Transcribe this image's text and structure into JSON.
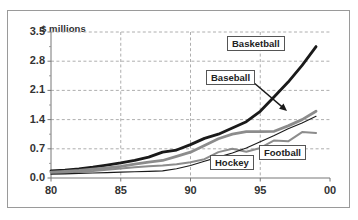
{
  "figure": {
    "width": 358,
    "height": 220,
    "background": "#ffffff",
    "frame_color": "#9a9a9a"
  },
  "chart_data": {
    "type": "line",
    "title": "",
    "subtitle": "",
    "xlabel": "",
    "ylabel": "$ millions",
    "ylabel_position": "top-left",
    "grid": true,
    "grid_style": "dashed",
    "grid_color": "#999999",
    "legend_position": "inline-labels",
    "xlim": [
      80,
      100
    ],
    "ylim": [
      0.0,
      3.5
    ],
    "x_ticks": [
      "80",
      "85",
      "90",
      "95",
      "00"
    ],
    "x_tick_values": [
      80,
      85,
      90,
      95,
      100
    ],
    "y_ticks": [
      "0.0",
      "0.7",
      "1.4",
      "2.1",
      "2.8",
      "3.5"
    ],
    "y_tick_values": [
      0.0,
      0.7,
      1.4,
      2.1,
      2.8,
      3.5
    ],
    "x": [
      80,
      81,
      82,
      83,
      84,
      85,
      86,
      87,
      88,
      89,
      90,
      91,
      92,
      93,
      94,
      95,
      96,
      97,
      98,
      99
    ],
    "series": [
      {
        "name": "Basketball",
        "color": "#1a1a1a",
        "width": 2.8,
        "values": [
          0.17,
          0.19,
          0.22,
          0.26,
          0.31,
          0.36,
          0.42,
          0.5,
          0.62,
          0.67,
          0.8,
          0.95,
          1.05,
          1.2,
          1.35,
          1.6,
          1.95,
          2.3,
          2.7,
          3.15
        ]
      },
      {
        "name": "Baseball",
        "color": "#8c8c8c",
        "width": 2.8,
        "values": [
          0.14,
          0.16,
          0.18,
          0.21,
          0.24,
          0.28,
          0.33,
          0.38,
          0.42,
          0.52,
          0.62,
          0.78,
          0.94,
          1.05,
          1.11,
          1.11,
          1.12,
          1.25,
          1.4,
          1.6
        ]
      },
      {
        "name": "Football",
        "color": "#8c8c8c",
        "width": 2.0,
        "values": [
          0.12,
          0.13,
          0.15,
          0.17,
          0.2,
          0.23,
          0.26,
          0.28,
          0.3,
          0.33,
          0.38,
          0.45,
          0.62,
          0.7,
          0.63,
          0.72,
          0.9,
          0.88,
          1.1,
          1.08
        ]
      },
      {
        "name": "Hockey",
        "color": "#1a1a1a",
        "width": 1.1,
        "values": [
          0.09,
          0.1,
          0.11,
          0.12,
          0.13,
          0.14,
          0.15,
          0.16,
          0.17,
          0.22,
          0.3,
          0.4,
          0.5,
          0.6,
          0.72,
          0.87,
          1.02,
          1.18,
          1.32,
          1.48
        ]
      }
    ],
    "annotations": [
      {
        "label": "Basketball",
        "type": "boxed-label",
        "x_px": 226,
        "y_px": 35
      },
      {
        "label": "Baseball",
        "type": "boxed-label-with-arrow",
        "x_px": 205,
        "y_px": 69,
        "arrow_from_px": [
          252,
          81
        ],
        "arrow_to_px": [
          286,
          110
        ]
      },
      {
        "label": "Hockey",
        "type": "boxed-label",
        "x_px": 209,
        "y_px": 154
      },
      {
        "label": "Football",
        "type": "boxed-label",
        "x_px": 258,
        "y_px": 144
      }
    ]
  },
  "plot_geometry": {
    "left": 50,
    "top": 31,
    "right": 329,
    "bottom": 177
  }
}
